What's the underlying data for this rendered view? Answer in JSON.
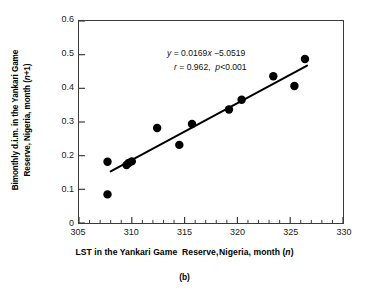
{
  "caption": "(b)",
  "annotation": {
    "line1_prefix": "y",
    "line1": "y = 0.0169x −5.0519",
    "line2": "r = 0.962,  p<0.001"
  },
  "chart_data": {
    "type": "scatter",
    "title": "",
    "subtitle": "",
    "xlabel": "LST in the Yankari Game  Reserve, Nigeria, month (n)",
    "ylabel": "Bimonthly d.i.m. in the Yankari Game Reserve, Nigeria, month (n+1)",
    "ylabel_line1": "Bimonthly d.i.m. in the Yankari Game",
    "ylabel_line2": "Reserve, Nigeria, month (n+1)",
    "xlim": [
      305,
      330
    ],
    "ylim": [
      0,
      0.6
    ],
    "xticks": [
      305,
      310,
      315,
      320,
      325,
      330
    ],
    "xtick_labels": [
      "305",
      "310",
      "315",
      "320",
      "325",
      "330"
    ],
    "xminor_step": 1,
    "yticks": [
      0,
      0.1,
      0.2,
      0.3,
      0.4,
      0.5,
      0.6
    ],
    "ytick_labels": [
      "0",
      "0.1",
      "0.2",
      "0.3",
      "0.4",
      "0.5",
      "0.6"
    ],
    "grid": false,
    "legend": null,
    "marker": "filled-circle",
    "marker_color": "#000000",
    "marker_size_px": 8.5,
    "x": [
      307.7,
      307.7,
      309.5,
      309.7,
      310.0,
      312.4,
      314.5,
      315.7,
      319.2,
      320.4,
      323.4,
      325.4,
      326.4
    ],
    "y": [
      0.182,
      0.085,
      0.172,
      0.178,
      0.183,
      0.282,
      0.232,
      0.294,
      0.337,
      0.366,
      0.436,
      0.407,
      0.487
    ],
    "points": [
      {
        "x": 307.7,
        "y": 0.182
      },
      {
        "x": 307.7,
        "y": 0.085
      },
      {
        "x": 309.5,
        "y": 0.172
      },
      {
        "x": 309.7,
        "y": 0.178
      },
      {
        "x": 310.0,
        "y": 0.183
      },
      {
        "x": 312.4,
        "y": 0.282
      },
      {
        "x": 314.5,
        "y": 0.232
      },
      {
        "x": 315.7,
        "y": 0.294
      },
      {
        "x": 319.2,
        "y": 0.337
      },
      {
        "x": 320.4,
        "y": 0.366
      },
      {
        "x": 323.4,
        "y": 0.436
      },
      {
        "x": 325.4,
        "y": 0.407
      },
      {
        "x": 326.4,
        "y": 0.487
      }
    ],
    "fit_line": {
      "slope": 0.0169,
      "intercept": -5.0519,
      "x_start": 308.0,
      "x_end": 326.6,
      "color": "#000000",
      "width_px": 2.0
    },
    "statistics": {
      "equation": "y = 0.0169x −5.0519",
      "r": 0.962,
      "p": "<0.001"
    },
    "annotations": [
      "y = 0.0169x −5.0519",
      "r = 0.962,  p<0.001"
    ]
  }
}
